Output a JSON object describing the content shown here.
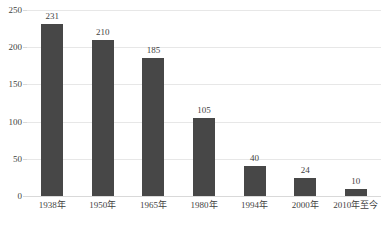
{
  "chart_data": {
    "type": "bar",
    "title": "",
    "subtitle": "",
    "xlabel": "",
    "ylabel": "",
    "categories": [
      "1938年",
      "1950年",
      "1965年",
      "1980年",
      "1994年",
      "2000年",
      "2010年至今"
    ],
    "values": [
      231,
      210,
      185,
      105,
      40,
      24,
      10
    ],
    "data_labels": [
      "231",
      "210",
      "185",
      "105",
      "40",
      "24",
      "10"
    ],
    "ylim": [
      0,
      250
    ],
    "ytick_step": 50,
    "ytick_labels": [
      "0",
      "50",
      "100",
      "150",
      "200",
      "250"
    ],
    "ytick_values": [
      0,
      50,
      100,
      150,
      200,
      250
    ],
    "grid": {
      "horizontal": true,
      "vertical": false,
      "color": "#e7e7e7"
    },
    "legend": {
      "visible": false,
      "position": "none",
      "entries": []
    },
    "series": [
      {
        "name": "",
        "color": "#474747",
        "values": [
          231,
          210,
          185,
          105,
          40,
          24,
          10
        ]
      }
    ],
    "colors": {
      "bar": "#474747",
      "gridline": "#e7e7e7",
      "axis": "#d9d9d9",
      "text": "#3f3f3f",
      "background": "#ffffff"
    }
  }
}
